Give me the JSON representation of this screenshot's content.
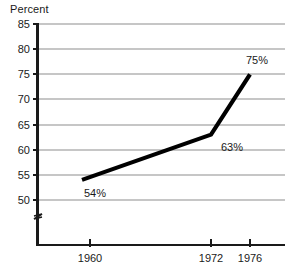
{
  "chart_data": {
    "type": "line",
    "title": "Percent",
    "xlabel": "",
    "ylabel": "Percent",
    "x": [
      1960,
      1972,
      1976
    ],
    "categories": [
      "1960",
      "1972",
      "1976"
    ],
    "values": [
      54,
      63,
      75
    ],
    "point_labels": [
      "54%",
      "63%",
      "75%"
    ],
    "ylim": [
      50,
      85
    ],
    "yticks": [
      50,
      55,
      60,
      65,
      70,
      75,
      80,
      85
    ],
    "ytick_labels": [
      "50",
      "55",
      "60",
      "65",
      "70",
      "75",
      "80",
      "85"
    ],
    "xticks": [
      1960,
      1972,
      1976
    ],
    "xtick_labels": [
      "1960",
      "1972",
      "1976"
    ],
    "grid": true,
    "legend": false,
    "axis_break": true,
    "series": [
      {
        "name": "Percent",
        "values": [
          54,
          63,
          75
        ]
      }
    ],
    "colors": {
      "line": "#000000",
      "grid": "#8d8d8d",
      "axis": "#1a1a1a",
      "text": "#1a1a1a",
      "background": "#ffffff"
    }
  }
}
